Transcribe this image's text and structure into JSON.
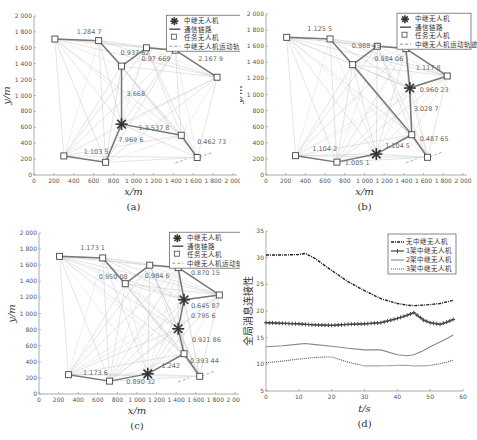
{
  "figure": {
    "panels": [
      "a",
      "b",
      "c",
      "d"
    ]
  },
  "chart_data": [
    {
      "id": "a",
      "type": "scatter",
      "caption": "(a)",
      "xlabel": "x/m",
      "ylabel": "y/m",
      "xlim": [
        0,
        2000
      ],
      "ylim": [
        0,
        2000
      ],
      "xticks": [
        "0",
        "200",
        "400",
        "600",
        "800",
        "1 000",
        "1 200",
        "1 400",
        "1 600",
        "1 800",
        "2 000"
      ],
      "yticks": [
        "0",
        "200",
        "400",
        "600",
        "800",
        "1 000",
        "1 200",
        "1 400",
        "1 600",
        "1 800",
        "2 000"
      ],
      "legend": [
        "中继无人机",
        "通信链路",
        "任务无人机",
        "中继无人机运动轨迹"
      ],
      "task_uavs": [
        [
          210,
          1710
        ],
        [
          650,
          1690
        ],
        [
          1130,
          1600
        ],
        [
          1420,
          1570
        ],
        [
          1840,
          1230
        ],
        [
          1480,
          500
        ],
        [
          1640,
          220
        ],
        [
          720,
          160
        ],
        [
          300,
          240
        ],
        [
          880,
          1370
        ]
      ],
      "relay_uavs": [
        [
          880,
          640
        ]
      ],
      "edge_labels": [
        "1.284 7",
        "0.937 62",
        "0.371 16",
        "2.167 9",
        "0.97 669",
        "3.668",
        "1.3.537 8",
        "7.969 6",
        "0.462 73",
        "1.103 5"
      ]
    },
    {
      "id": "b",
      "type": "scatter",
      "caption": "(b)",
      "xlabel": "x/m",
      "ylabel": "y/m",
      "xlim": [
        0,
        2000
      ],
      "ylim": [
        0,
        2000
      ],
      "xticks": [
        "0",
        "200",
        "400",
        "600",
        "800",
        "1 000",
        "1 200",
        "1 400",
        "1 600",
        "1 800",
        "2 000"
      ],
      "yticks": [
        "0",
        "200",
        "400",
        "600",
        "800",
        "1 000",
        "1 200",
        "1 400",
        "1 600",
        "1 800",
        "2 000"
      ],
      "legend": [
        "中继无人机",
        "通信链路",
        "任务无人机",
        "中继无人机运动轨迹"
      ],
      "task_uavs": [
        [
          210,
          1710
        ],
        [
          650,
          1690
        ],
        [
          1130,
          1600
        ],
        [
          1420,
          1570
        ],
        [
          1840,
          1230
        ],
        [
          1480,
          500
        ],
        [
          1640,
          220
        ],
        [
          720,
          160
        ],
        [
          300,
          240
        ],
        [
          880,
          1370
        ]
      ],
      "relay_uavs": [
        [
          1460,
          1080
        ],
        [
          1120,
          260
        ]
      ],
      "edge_labels": [
        "1.125 5",
        "0.988 45",
        "0.383 01",
        "0.984 06",
        "1.117 8",
        "0.960 23",
        "3.028 7",
        "0.487 65",
        "1.104 5",
        "1.104 2",
        "1.005 1"
      ]
    },
    {
      "id": "c",
      "type": "scatter",
      "caption": "(c)",
      "xlabel": "x/m",
      "ylabel": "y/m",
      "xlim": [
        0,
        2000
      ],
      "ylim": [
        0,
        2000
      ],
      "xticks": [
        "0",
        "200",
        "400",
        "600",
        "800",
        "1 000",
        "1 200",
        "1 400",
        "1 600",
        "1 800",
        "2 000"
      ],
      "yticks": [
        "0",
        "200",
        "400",
        "600",
        "800",
        "1 000",
        "1 200",
        "1 400",
        "1 600",
        "1 800",
        "2 000"
      ],
      "legend": [
        "中继无人机",
        "通信链路",
        "任务无人机",
        "中继无人机运动轨迹"
      ],
      "task_uavs": [
        [
          210,
          1710
        ],
        [
          650,
          1690
        ],
        [
          1130,
          1600
        ],
        [
          1420,
          1570
        ],
        [
          1840,
          1230
        ],
        [
          1480,
          500
        ],
        [
          1640,
          220
        ],
        [
          720,
          160
        ],
        [
          300,
          240
        ],
        [
          880,
          1370
        ]
      ],
      "relay_uavs": [
        [
          1480,
          1170
        ],
        [
          1420,
          810
        ],
        [
          1110,
          250
        ]
      ],
      "edge_labels": [
        "1.173 1",
        "0.950 08",
        "0.383 44",
        "0.984 6",
        "0.870 15",
        "0.645 87",
        "0.795 6",
        "0.921 86",
        "0.393 44",
        "1.242",
        "1.173 6",
        "0.890 32"
      ]
    },
    {
      "id": "d",
      "type": "line",
      "caption": "(d)",
      "xlabel": "t/s",
      "ylabel": "全局消息连接性",
      "xlim": [
        0,
        60
      ],
      "ylim": [
        5,
        35
      ],
      "xticks": [
        "0",
        "10",
        "20",
        "30",
        "40",
        "50",
        "60"
      ],
      "yticks": [
        "5",
        "10",
        "15",
        "20",
        "25",
        "30",
        "35"
      ],
      "legend_position": "upper right",
      "x": [
        0,
        5,
        10,
        12,
        15,
        20,
        25,
        30,
        35,
        40,
        43,
        45,
        48,
        50,
        53,
        55,
        57
      ],
      "series": [
        {
          "name": "无中继无人机",
          "style": "dashdot",
          "values": [
            30.5,
            30.5,
            30.6,
            30.8,
            29.8,
            27.6,
            25.5,
            23.8,
            22.3,
            21.4,
            21.1,
            21.0,
            21.1,
            21.2,
            21.4,
            21.7,
            22.0
          ]
        },
        {
          "name": "1架中继无人机",
          "style": "marker",
          "values": [
            17.8,
            17.7,
            17.6,
            17.5,
            17.4,
            17.3,
            17.5,
            17.6,
            17.8,
            18.6,
            19.2,
            19.7,
            18.3,
            17.8,
            17.5,
            17.9,
            18.4
          ]
        },
        {
          "name": "2架中继无人机",
          "style": "solid",
          "values": [
            13.3,
            13.5,
            13.8,
            13.9,
            13.7,
            13.4,
            13.0,
            12.7,
            12.7,
            11.8,
            11.6,
            11.8,
            12.6,
            13.3,
            14.2,
            14.8,
            15.5
          ]
        },
        {
          "name": "3架中继无人机",
          "style": "dotted",
          "values": [
            10.3,
            10.6,
            11.0,
            11.1,
            11.3,
            11.4,
            10.4,
            9.7,
            9.7,
            9.8,
            9.8,
            9.7,
            9.7,
            9.8,
            10.1,
            10.4,
            10.8
          ]
        }
      ]
    }
  ]
}
